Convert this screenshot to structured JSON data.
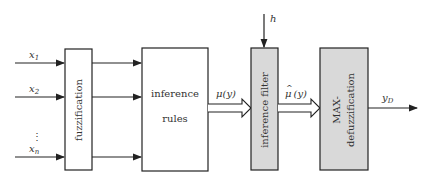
{
  "diagram": {
    "inputs": [
      {
        "label": "x",
        "sub": "1"
      },
      {
        "label": "x",
        "sub": "2"
      },
      {
        "label": "x",
        "sub": "n"
      }
    ],
    "ellipsis": "⋮",
    "blocks": {
      "fuzzification": "fuzzification",
      "inference_rules_line1": "inference",
      "inference_rules_line2": "rules",
      "inference_filter": "inference filter",
      "max_line1": "MAX-",
      "max_line2": "defuzzification"
    },
    "signals": {
      "mu": "μ(y)",
      "mu_hat_base": "μ",
      "mu_hat_hat": "^",
      "mu_hat_arg": "(y)",
      "h": "h",
      "output": "y",
      "output_sub": "D"
    },
    "colors": {
      "line": "#222222",
      "shaded_fill": "#d9d9d9",
      "box_fill": "#ffffff"
    }
  }
}
